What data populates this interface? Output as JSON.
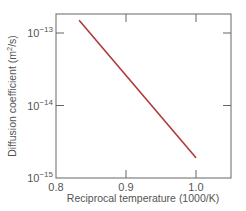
{
  "chart_data": {
    "type": "line",
    "title": "",
    "xlabel": "Reciprocal temperature (1000/K)",
    "ylabel": "Diffusion coefficient (m²/s)",
    "xlim": [
      0.8,
      1.05
    ],
    "ylim": [
      1e-15,
      2e-13
    ],
    "yscale": "log",
    "grid": false,
    "legend": null,
    "x_ticks": [
      {
        "value": 0.8,
        "label": "0.8"
      },
      {
        "value": 0.9,
        "label": "0.9"
      },
      {
        "value": 1.0,
        "label": "1.0"
      }
    ],
    "y_ticks": [
      {
        "value": 1e-13,
        "base": "10",
        "exp": "−13"
      },
      {
        "value": 1e-14,
        "base": "10",
        "exp": "−14"
      },
      {
        "value": 1e-15,
        "base": "10",
        "exp": "−15"
      }
    ],
    "series": [
      {
        "name": "Diffusion coefficient",
        "color": "#b03a3a",
        "x": [
          0.833,
          1.0
        ],
        "y": [
          1.5e-13,
          1.9e-15
        ]
      }
    ]
  },
  "colors": {
    "line": "#b03a3a",
    "axis": "#666666",
    "text": "#555555"
  }
}
